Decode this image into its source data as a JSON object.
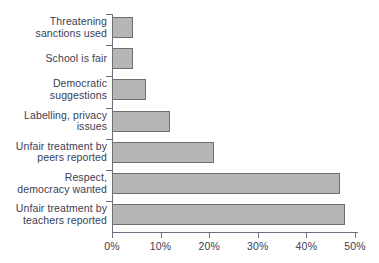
{
  "chart_data": {
    "type": "bar",
    "orientation": "horizontal",
    "title": "",
    "subtitle": "",
    "xlabel": "",
    "ylabel": "",
    "xlim": [
      0,
      50
    ],
    "grid": false,
    "legend": null,
    "xticks": [
      0,
      10,
      20,
      30,
      40,
      50
    ],
    "xtick_labels": [
      "0%",
      "10%",
      "20%",
      "30%",
      "40%",
      "50%"
    ],
    "categories": [
      "Threatening\nsanctions used",
      "School is fair",
      "Democratic\nsuggestions",
      "Labelling, privacy\nissues",
      "Unfair treatment by\npeers reported",
      "Respect,\ndemocracy wanted",
      "Unfair treatment by\nteachers reported"
    ],
    "values": [
      4.3,
      4.3,
      7,
      12,
      21,
      47,
      48
    ],
    "colors": {
      "bar_fill": "#b6b6b6",
      "bar_border": "#6f6f6f",
      "axis": "#6d7280",
      "text": "#3b4055",
      "background": "#ffffff"
    }
  }
}
